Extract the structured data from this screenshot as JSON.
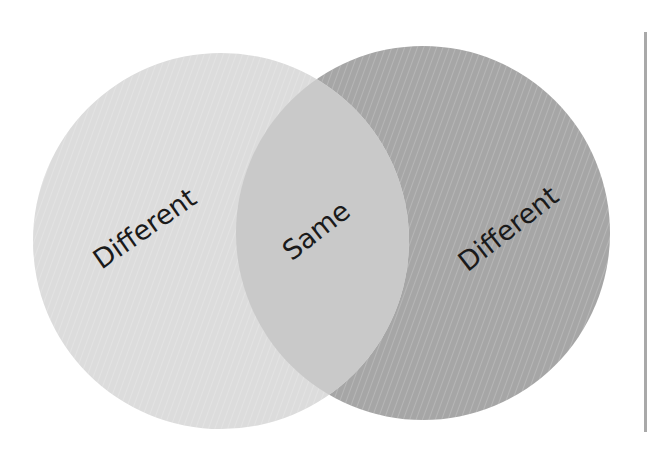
{
  "diagram": {
    "type": "venn",
    "sets": [
      {
        "id": "left",
        "label": "Different",
        "color": "#dcdcdc"
      },
      {
        "id": "right",
        "label": "Different",
        "color": "#a6a6a6"
      }
    ],
    "intersection": {
      "label": "Same",
      "color": "#c9c9c9"
    },
    "frame_line_color": "#a9a9a9"
  }
}
